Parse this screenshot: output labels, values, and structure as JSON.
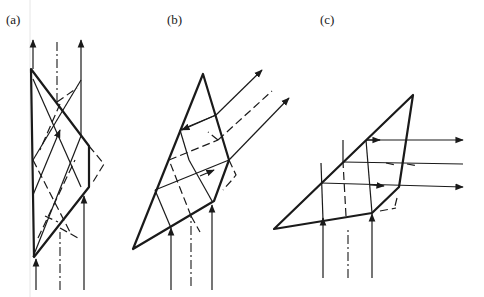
{
  "figure": {
    "panels": [
      {
        "id": "a",
        "label": "(a)"
      },
      {
        "id": "b",
        "label": "(b)"
      },
      {
        "id": "c",
        "label": "(c)"
      }
    ]
  },
  "colors": {
    "line": "#1a1a1a",
    "background": "#ffffff"
  }
}
